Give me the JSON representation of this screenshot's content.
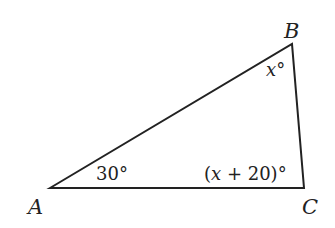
{
  "diagram": {
    "type": "triangle",
    "stroke_color": "#222222",
    "vertices": {
      "A": {
        "label": "A",
        "x": 50,
        "y": 188
      },
      "B": {
        "label": "B",
        "x": 292,
        "y": 44
      },
      "C": {
        "label": "C",
        "x": 304,
        "y": 188
      }
    },
    "angles": {
      "A": {
        "text": "30°"
      },
      "B": {
        "var": "x",
        "deg": "°"
      },
      "C": {
        "open": "(",
        "var": "x",
        "rest": " + 20)°"
      }
    }
  }
}
